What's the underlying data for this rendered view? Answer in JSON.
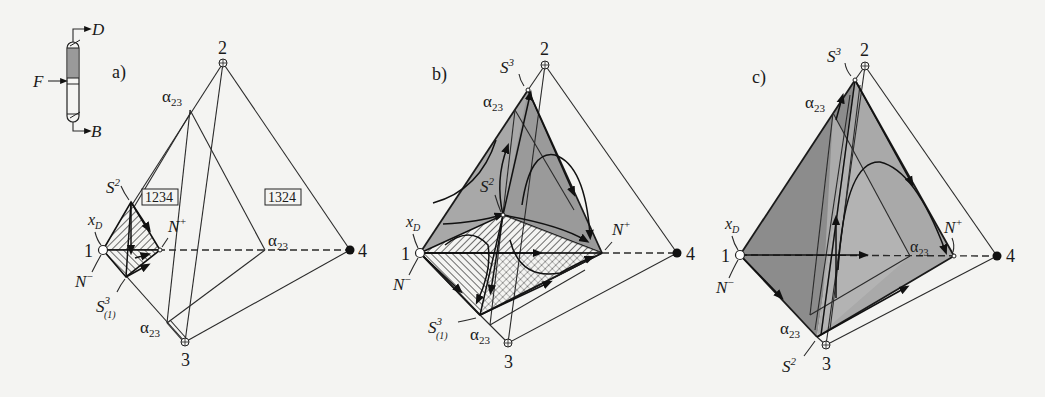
{
  "figure": {
    "column_icon": {
      "feed_label": "F",
      "distillate_label": "D",
      "bottoms_label": "B"
    },
    "panels": [
      {
        "id": "a",
        "label": "a)",
        "vertices": {
          "v1": "1",
          "v2": "2",
          "v3": "3",
          "v4": "4"
        },
        "annotations": {
          "alpha_top": "α",
          "alpha_top_sub": "23",
          "alpha_mid": "α",
          "alpha_mid_sub": "23",
          "alpha_bottom": "α",
          "alpha_bottom_sub": "23",
          "s2": "S",
          "s2_sup": "2",
          "xd": "x",
          "xd_sub": "D",
          "n_plus": "N",
          "n_plus_sup": "+",
          "n_minus": "N",
          "n_minus_sup": "−",
          "s31": "S",
          "s31_sup": "3",
          "s31_sub": "(1)",
          "box1": "1234",
          "box2": "1324"
        }
      },
      {
        "id": "b",
        "label": "b)",
        "vertices": {
          "v1": "1",
          "v2": "2",
          "v3": "3",
          "v4": "4"
        },
        "annotations": {
          "s3": "S",
          "s3_sup": "3",
          "alpha_top": "α",
          "alpha_top_sub": "23",
          "s2": "S",
          "s2_sup": "2",
          "xd": "x",
          "xd_sub": "D",
          "n_plus": "N",
          "n_plus_sup": "+",
          "n_minus": "N",
          "n_minus_sup": "−",
          "s31": "S",
          "s31_sup": "3",
          "s31_sub": "(1)",
          "alpha_bottom": "α",
          "alpha_bottom_sub": "23"
        }
      },
      {
        "id": "c",
        "label": "c)",
        "vertices": {
          "v1": "1",
          "v2": "2",
          "v3": "3",
          "v4": "4"
        },
        "annotations": {
          "s3": "S",
          "s3_sup": "3",
          "alpha_top": "α",
          "alpha_top_sub": "23",
          "xd": "x",
          "xd_sub": "D",
          "n_plus": "N",
          "n_plus_sup": "+",
          "n_minus": "N",
          "n_minus_sup": "−",
          "alpha_mid": "α",
          "alpha_mid_sub": "23",
          "alpha_bottom": "α",
          "alpha_bottom_sub": "23",
          "s2": "S",
          "s2_sup": "2"
        }
      }
    ],
    "colors": {
      "background": "#f4f4f2",
      "line": "#1a1a1a",
      "shade_dark": "#8a8a8a",
      "shade_mid": "#a6a6a6",
      "shade_light": "#bdbdbd",
      "column_fill": "#9a9a9a"
    }
  }
}
